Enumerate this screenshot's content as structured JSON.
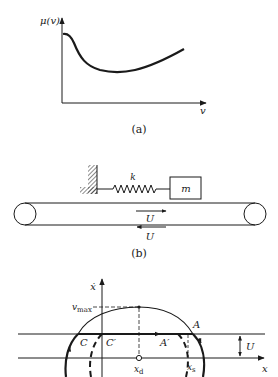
{
  "figure_a": {
    "y_axis_label": "μ(v)",
    "x_axis_label": "v",
    "caption": "(a)",
    "curve_description": "friction coefficient vs velocity: high at v=0, falls to a minimum, then rises"
  },
  "figure_b": {
    "spring_label": "k",
    "mass_label": "m",
    "belt_top_velocity_label": "U",
    "belt_bottom_velocity_label": "U",
    "caption": "(b)"
  },
  "figure_c": {
    "y_axis_label": "ẋ",
    "x_axis_label": "x",
    "vmax_label": "v",
    "vmax_subscript": "max",
    "point_A": "A",
    "point_A_prime": "A′",
    "point_C": "C",
    "point_C_prime": "C′",
    "xd_label": "x",
    "xd_subscript": "d",
    "xs_label": "x",
    "xs_subscript": "s",
    "U_label": "U"
  },
  "colors": {
    "ink": "#1a1a1a",
    "background": "#ffffff"
  }
}
